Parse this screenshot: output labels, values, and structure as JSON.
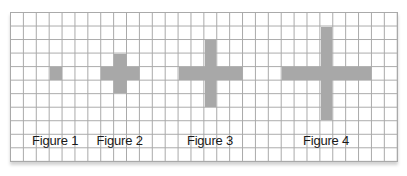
{
  "grid": {
    "columns": 30,
    "rows": 11,
    "line_color": "#a9a9a9",
    "fill_color": "#a8a8a8"
  },
  "figures": [
    {
      "label": "Figure 1",
      "center": {
        "col": 3,
        "row": 4
      },
      "arm_length": 0
    },
    {
      "label": "Figure 2",
      "center": {
        "col": 8,
        "row": 4
      },
      "arm_length": 1
    },
    {
      "label": "Figure 3",
      "center": {
        "col": 15,
        "row": 4
      },
      "arm_length": 2
    },
    {
      "label": "Figure 4",
      "center": {
        "col": 24,
        "row": 4
      },
      "arm_length": 3
    }
  ],
  "label_row": 9
}
